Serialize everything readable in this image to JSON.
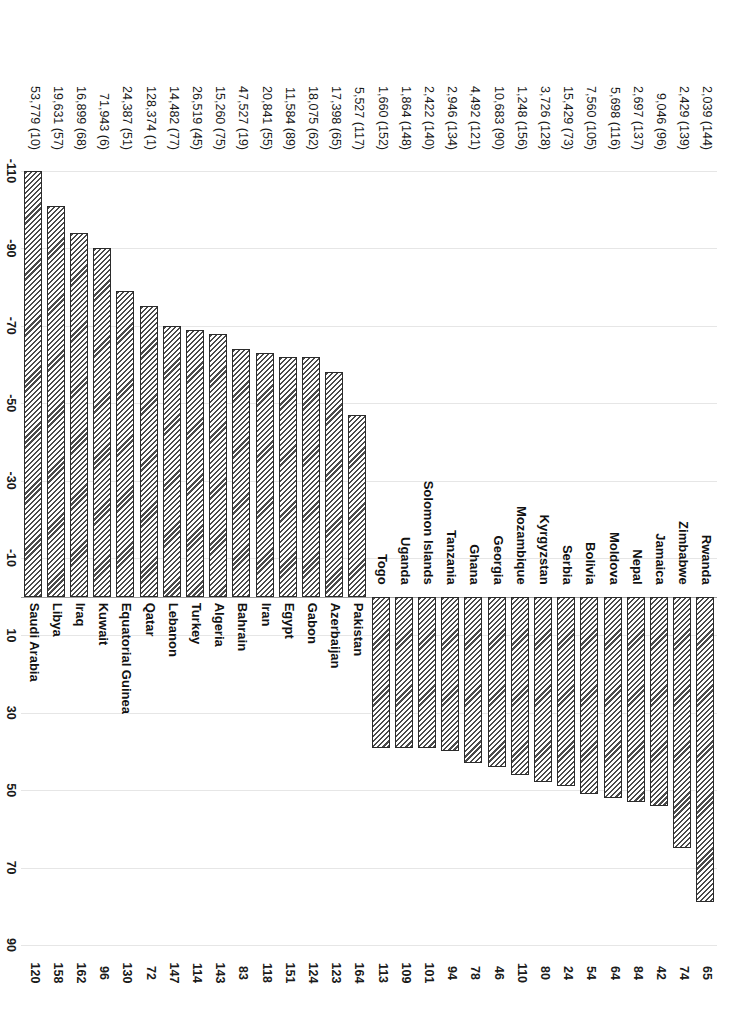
{
  "chart_data": {
    "type": "bar",
    "orientation": "vertical-rotated",
    "title": "",
    "xlabel": "",
    "ylabel": "Number of places higher or lower in index ranking than in income per capita ranking",
    "ylim": [
      -110,
      90
    ],
    "ytick_step": 20,
    "yticks": [
      "-110",
      "-90",
      "-70",
      "-50",
      "-30",
      "-10",
      "10",
      "30",
      "50",
      "70",
      "90"
    ],
    "grid": true,
    "legend": null,
    "bar_color": "#ffffff",
    "bar_edge_color": "#2b2b2b",
    "bar_hatch": "diagonal",
    "categories": [
      "Rwanda",
      "Zimbabwe",
      "Jamaica",
      "Nepal",
      "Moldova",
      "Bolivia",
      "Serbia",
      "Kyrgyzstan",
      "Mozambique",
      "Georgia",
      "Ghana",
      "Tanzania",
      "Solomon Islands",
      "Uganda",
      "Togo",
      "Pakistan",
      "Azerbaijan",
      "Gabon",
      "Egypt",
      "Iran",
      "Bahrain",
      "Algeria",
      "Turkey",
      "Lebanon",
      "Qatar",
      "Equatorial Guinea",
      "Kuwait",
      "Iraq",
      "Libya",
      "Saudi Arabia"
    ],
    "values": [
      79,
      65,
      54,
      53,
      52,
      51,
      49,
      48,
      46,
      44,
      43,
      40,
      39,
      39,
      39,
      -47,
      -58,
      -62,
      -62,
      -63,
      -64,
      -68,
      -69,
      -70,
      -75,
      -79,
      -90,
      -94,
      -101,
      -110
    ],
    "index_rank": [
      65,
      74,
      42,
      84,
      64,
      54,
      24,
      80,
      110,
      46,
      78,
      94,
      101,
      109,
      113,
      164,
      123,
      124,
      151,
      118,
      83,
      143,
      114,
      147,
      72,
      130,
      96,
      162,
      158,
      120
    ],
    "income_rank": [
      144,
      139,
      96,
      137,
      116,
      105,
      73,
      128,
      156,
      90,
      121,
      134,
      140,
      148,
      152,
      117,
      65,
      62,
      89,
      55,
      19,
      75,
      45,
      77,
      1,
      51,
      6,
      68,
      57,
      10
    ],
    "income_labels": [
      "2,039 (144)",
      "2,429 (139)",
      "9,046 (96)",
      "2,697 (137)",
      "5,698 (116)",
      "7,560 (105)",
      "15,429 (73)",
      "3,726 (128)",
      "1,248 (156)",
      "10,683 (90)",
      "4,492 (121)",
      "2,946 (134)",
      "2,422 (140)",
      "1,864 (148)",
      "1,660 (152)",
      "5,527 (117)",
      "17,398 (65)",
      "18,075 (62)",
      "11,584 (89)",
      "20,841 (55)",
      "47,527 (19)",
      "15,260 (75)",
      "26,519 (45)",
      "14,482 (77)",
      "128,374 (1)",
      "24,387 (51)",
      "71,943 (6)",
      "16,899 (68)",
      "19,631 (57)",
      "53,779 (10)"
    ],
    "index_rank_labels": [
      "65",
      "74",
      "42",
      "84",
      "64",
      "54",
      "24",
      "80",
      "110",
      "46",
      "78",
      "94",
      "101",
      "109",
      "113",
      "164",
      "123",
      "124",
      "151",
      "118",
      "83",
      "143",
      "114",
      "147",
      "72",
      "130",
      "96",
      "162",
      "158",
      "120"
    ]
  }
}
